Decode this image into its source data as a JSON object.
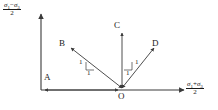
{
  "figure": {
    "type": "stress-path-diagram",
    "background_color": "#ffffff",
    "stroke_color": "#3a3a3a",
    "text_color": "#1a1a1a"
  },
  "axes": {
    "y": {
      "label_numerator_sigma1": "σ",
      "label_numerator_sub1": "1",
      "label_minus": "−",
      "label_numerator_sigma3": "σ",
      "label_numerator_sub3": "3",
      "label_denominator": "2",
      "label_plain": "(σ₁ − σ₃)/2"
    },
    "x": {
      "label_numerator_sigma1": "σ",
      "label_numerator_sub1": "1",
      "label_plus": "+",
      "label_numerator_sigma3": "σ",
      "label_numerator_sub3": "3",
      "label_denominator": "2",
      "label_plain": "(σ₁ + σ₃)/2"
    }
  },
  "points": [
    {
      "id": "A",
      "label": "A",
      "x": 49,
      "y": 78,
      "note": "point on horizontal axis left of origin"
    },
    {
      "id": "B",
      "label": "B",
      "x": 63,
      "y": 44,
      "note": "upper-left end of descending path"
    },
    {
      "id": "C",
      "label": "C",
      "x": 117,
      "y": 26,
      "note": "top of vertical path"
    },
    {
      "id": "D",
      "label": "D",
      "x": 153,
      "y": 44,
      "note": "upper-right end of ascending path"
    },
    {
      "id": "O",
      "label": "O",
      "x": 122,
      "y": 92,
      "note": "origin"
    }
  ],
  "slope_ticks": [
    {
      "id": "left-vertical-1",
      "label": "1",
      "x": 80,
      "y": 63
    },
    {
      "id": "left-horizontal-1",
      "label": "1",
      "x": 89,
      "y": 70
    },
    {
      "id": "right-vertical-1",
      "label": "1",
      "x": 136,
      "y": 63
    },
    {
      "id": "right-horizontal-1",
      "label": "1",
      "x": 127,
      "y": 70
    }
  ],
  "paths": [
    {
      "id": "OB",
      "from": "O",
      "to": "B",
      "slope": "1:1 descending to left",
      "arrow_at": "both"
    },
    {
      "id": "OC",
      "from": "O",
      "to": "C",
      "slope": "vertical",
      "arrow_at": "both"
    },
    {
      "id": "OD",
      "from": "O",
      "to": "D",
      "slope": "1:1 ascending to right",
      "arrow_at": "both"
    },
    {
      "id": "OA",
      "from": "O",
      "to": "A",
      "slope": "horizontal to left",
      "arrow_at": "both"
    }
  ]
}
